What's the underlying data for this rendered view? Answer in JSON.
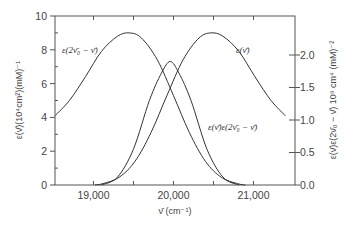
{
  "chart_data": {
    "type": "line",
    "title": "",
    "xlabel": "ν̄ (cm⁻¹)",
    "ylabel_left": "ε(ν̄)(10⁴cm²)(mM)⁻¹",
    "ylabel_right": "ε(ν̄)ε(2ν̄₀ − ν̄) 10⁹ cm⁴ (mM)⁻²",
    "xlim": [
      18520,
      21520
    ],
    "ylim_left": [
      0,
      10
    ],
    "ylim_right": [
      0,
      2.6
    ],
    "x_ticks": [
      19000,
      19500,
      20000,
      20500,
      21000
    ],
    "x_tick_labels": [
      "19,000",
      "",
      "20,000",
      "",
      "21,000"
    ],
    "y_left_ticks": [
      0,
      1,
      2,
      3,
      4,
      5,
      6,
      7,
      8,
      9,
      10
    ],
    "y_left_tick_labels": [
      "0",
      "",
      "2",
      "",
      "4",
      "",
      "6",
      "",
      "8",
      "",
      "10"
    ],
    "y_right_ticks": [
      0.0,
      0.5,
      1.0,
      1.5,
      2.0
    ],
    "y_right_tick_labels": [
      "0.0",
      "0.5",
      "1.0",
      "1.5",
      "2.0"
    ],
    "grid": false,
    "series": [
      {
        "name": "ε(2ν̄₀ − ν̄)",
        "axis": "left",
        "x": [
          18520,
          18700,
          18900,
          19100,
          19300,
          19450,
          19600,
          19800,
          20000,
          20200,
          20400,
          20600,
          20800,
          20900
        ],
        "values": [
          4.1,
          5.0,
          6.4,
          7.9,
          8.8,
          9.0,
          8.7,
          7.4,
          5.3,
          3.1,
          1.4,
          0.45,
          0.08,
          0.0
        ]
      },
      {
        "name": "ε(ν̄)",
        "axis": "left",
        "x": [
          19020,
          19120,
          19320,
          19520,
          19720,
          19920,
          20120,
          20320,
          20470,
          20620,
          20820,
          21020,
          21220,
          21400
        ],
        "values": [
          0.0,
          0.08,
          0.45,
          1.4,
          3.1,
          5.3,
          7.4,
          8.7,
          9.0,
          8.8,
          7.9,
          6.4,
          5.0,
          4.1
        ]
      },
      {
        "name": "ε(ν̄)ε(2ν̄₀ − ν̄)",
        "axis": "right",
        "x": [
          19100,
          19300,
          19500,
          19700,
          19850,
          19960,
          20070,
          20220,
          20420,
          20620,
          20820
        ],
        "values": [
          0.0,
          0.12,
          0.55,
          1.3,
          1.72,
          1.9,
          1.72,
          1.3,
          0.55,
          0.12,
          0.0
        ]
      }
    ],
    "annotations": [
      {
        "text": "ε(2ν̄₀ − ν̄)",
        "x": 18700,
        "y": 8.1
      },
      {
        "text": "ε(ν̄)",
        "x": 20700,
        "y": 8.1
      },
      {
        "text": "ε(ν̄)ε(2ν̄₀ − ν̄)",
        "x": 20100,
        "y": 3.4
      }
    ]
  },
  "labels": {
    "ytick_left_0": "0",
    "ytick_left_2": "2",
    "ytick_left_4": "4",
    "ytick_left_6": "6",
    "ytick_left_8": "8",
    "ytick_left_10": "10",
    "ytick_right_0": "0.0",
    "ytick_right_05": "0.5",
    "ytick_right_1": "1.0",
    "ytick_right_15": "1.5",
    "ytick_right_2": "2.0",
    "xtick_19000": "19,000",
    "xtick_20000": "20,000",
    "xtick_21000": "21,000",
    "xlabel": "ν̄ (cm⁻¹)",
    "ylabel_left": "ε(ν̄)(10⁴cm²)(mM)⁻¹",
    "ylabel_right": "ε(ν̄)ε(2ν̄₀ − ν̄) 10⁹ cm⁴ (mM)⁻²",
    "anno_mirror": "ε(2ν̄₀ − ν̄)",
    "anno_eps": "ε(ν̄)",
    "anno_product": "ε(ν̄)ε(2ν̄₀ − ν̄)"
  }
}
